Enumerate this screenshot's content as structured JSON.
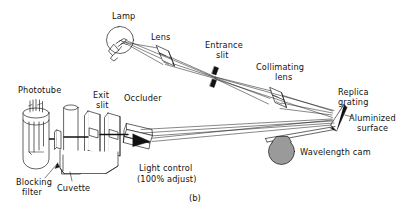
{
  "figure": {
    "caption": "(b)",
    "background_color": "#ffffff",
    "ink_color": "#111111",
    "cam_fill_color": "#9a9a9a",
    "grating_fill_color": "#111111"
  },
  "labels": {
    "lamp": "Lamp",
    "lens": "Lens",
    "entrance_slit_line1": "Entrance",
    "entrance_slit_line2": "slit",
    "collimating_lens_line1": "Collimating",
    "collimating_lens_line2": "lens",
    "replica_grating_line1": "Replica",
    "replica_grating_line2": "grating",
    "aluminized_surface_line1": "Aluminized",
    "aluminized_surface_line2": "surface",
    "wavelength_cam": "Wavelength cam",
    "phototube": "Phototube",
    "exit_slit_line1": "Exit",
    "exit_slit_line2": "slit",
    "occluder": "Occluder",
    "light_control_line1": "Light control",
    "light_control_line2": "(100% adjust)",
    "blocking_filter_line1": "Blocking",
    "blocking_filter_line2": "filter",
    "cuvette": "Cuvette"
  },
  "components": [
    {
      "name": "lamp",
      "label": "Lamp"
    },
    {
      "name": "lens",
      "label": "Lens"
    },
    {
      "name": "entrance-slit",
      "label": "Entrance slit"
    },
    {
      "name": "collimating-lens",
      "label": "Collimating lens"
    },
    {
      "name": "replica-grating",
      "label": "Replica grating"
    },
    {
      "name": "aluminized-surface",
      "label": "Aluminized surface"
    },
    {
      "name": "wavelength-cam",
      "label": "Wavelength cam"
    },
    {
      "name": "light-control",
      "label": "Light control (100% adjust)"
    },
    {
      "name": "occluder",
      "label": "Occluder"
    },
    {
      "name": "exit-slit",
      "label": "Exit slit"
    },
    {
      "name": "cuvette",
      "label": "Cuvette"
    },
    {
      "name": "blocking-filter",
      "label": "Blocking filter"
    },
    {
      "name": "phototube",
      "label": "Phototube"
    }
  ]
}
